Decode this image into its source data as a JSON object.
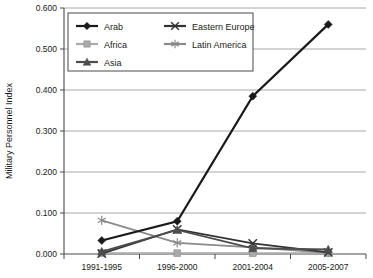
{
  "chart_data": {
    "type": "line",
    "title": "",
    "xlabel": "",
    "ylabel": "Military Personnel Index",
    "categories": [
      "1991-1995",
      "1996-2000",
      "2001-2004",
      "2005-2007"
    ],
    "ylim": [
      0.0,
      0.6
    ],
    "ytick_labels": [
      "0.000",
      "0.100",
      "0.200",
      "0.300",
      "0.400",
      "0.500",
      "0.600"
    ],
    "ytick_values": [
      0.0,
      0.1,
      0.2,
      0.3,
      0.4,
      0.5,
      0.6
    ],
    "grid": "horizontal",
    "legend_position": "top-left-inside",
    "series": [
      {
        "name": "Arab",
        "marker": "diamond",
        "color": "#1a1a1a",
        "values": [
          0.033,
          0.08,
          0.385,
          0.56
        ]
      },
      {
        "name": "Africa",
        "marker": "square",
        "color": "#aaaaaa",
        "values": [
          0.002,
          0.002,
          0.002,
          0.002
        ]
      },
      {
        "name": "Asia",
        "marker": "triangle",
        "color": "#4d4d4d",
        "values": [
          0.006,
          0.059,
          0.014,
          0.011
        ]
      },
      {
        "name": "Eastern Europe",
        "marker": "cross-x",
        "color": "#333333",
        "values": [
          0.001,
          0.06,
          0.026,
          0.004
        ]
      },
      {
        "name": "Latin America",
        "marker": "asterisk",
        "color": "#8a8a8a",
        "values": [
          0.082,
          0.027,
          0.016,
          0.003
        ]
      }
    ]
  },
  "legend": {
    "entries": [
      {
        "label": "Arab"
      },
      {
        "label": "Eastern Europe"
      },
      {
        "label": "Africa"
      },
      {
        "label": "Latin America"
      },
      {
        "label": "Asia"
      }
    ]
  },
  "plot_geometry": {
    "left": 64,
    "right": 366,
    "top": 8,
    "bottom": 254
  }
}
